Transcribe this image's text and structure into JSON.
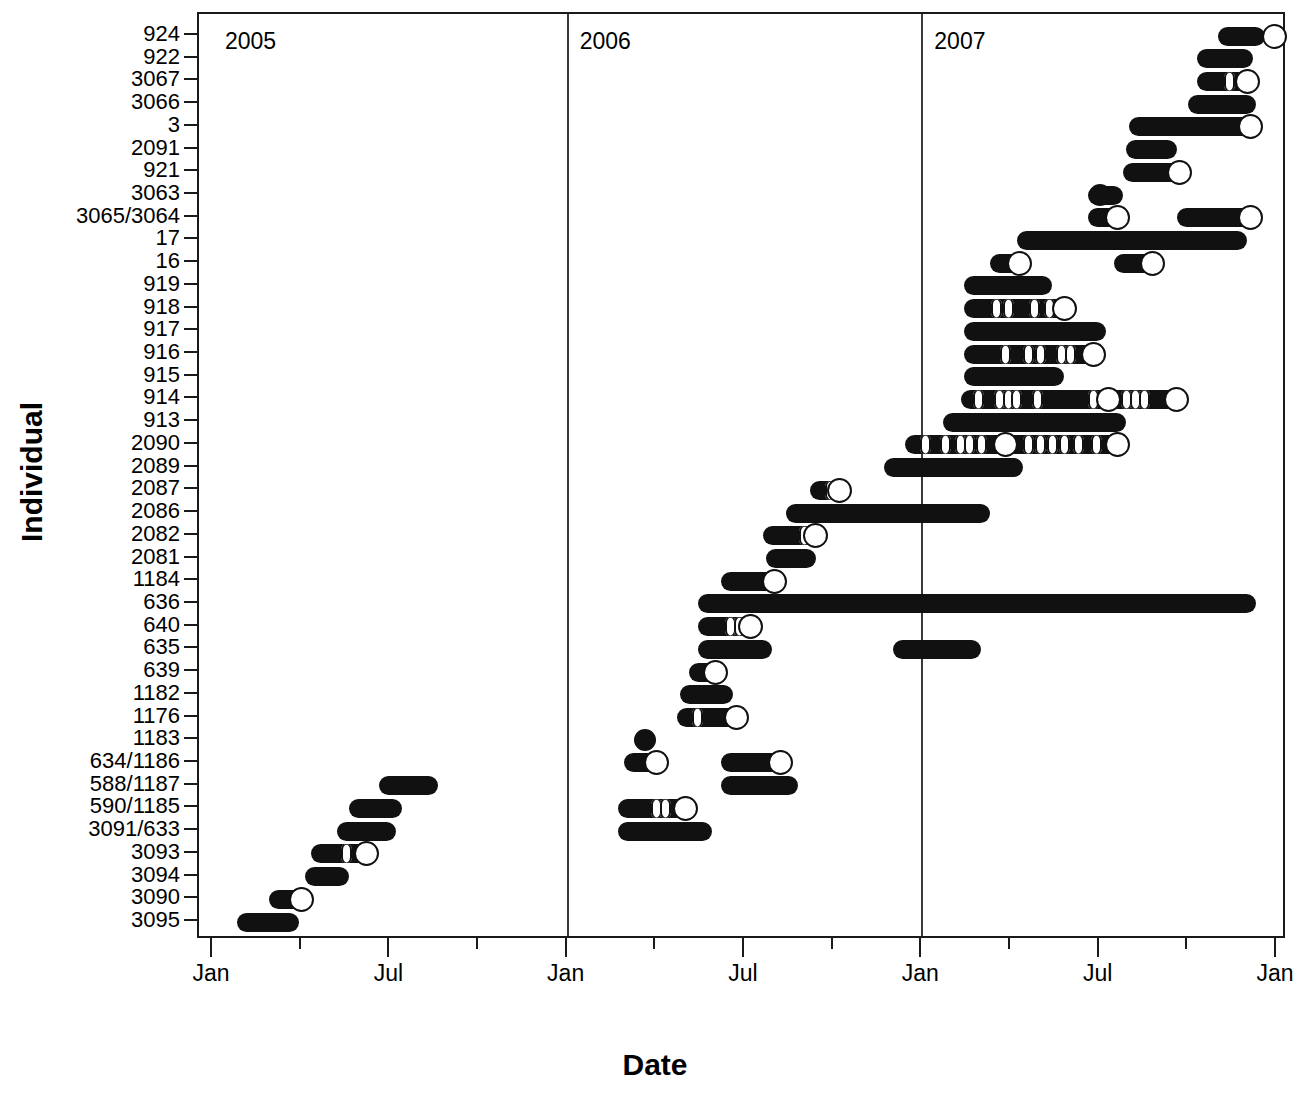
{
  "chart_data": {
    "type": "bar",
    "chart_subtype": "horizontal-gantt-timeline",
    "title": "",
    "xlabel": "Date",
    "ylabel": "Individual",
    "xlim": [
      "2005-01-01",
      "2008-01-01"
    ],
    "x_tick_labels": [
      "Jan",
      "Jul",
      "Jan",
      "Jul",
      "Jan",
      "Jul",
      "Jan"
    ],
    "x_tick_major_months": [
      0,
      6,
      12,
      18,
      24,
      30,
      36
    ],
    "x_minor_tick_interval_months": 3,
    "grid": false,
    "legend": null,
    "year_separators": [
      {
        "label": "2005",
        "at_month": 0
      },
      {
        "label": "2006",
        "at_month": 12
      },
      {
        "label": "2007",
        "at_month": 24
      }
    ],
    "categories": [
      "924",
      "922",
      "3067",
      "3066",
      "3",
      "2091",
      "921",
      "3063",
      "3065/3064",
      "17",
      "16",
      "919",
      "918",
      "917",
      "916",
      "915",
      "914",
      "913",
      "2090",
      "2089",
      "2087",
      "2086",
      "2082",
      "2081",
      "1184",
      "636",
      "640",
      "635",
      "639",
      "1182",
      "1176",
      "1183",
      "634/1186",
      "588/1187",
      "590/1185",
      "3091/633",
      "3093",
      "3094",
      "3090",
      "3095"
    ],
    "series": [
      {
        "individual": "924",
        "segments": [
          {
            "start_month": 34.0,
            "end_month": 35.6
          }
        ],
        "open_circles": [
          35.9
        ],
        "filled_dots": []
      },
      {
        "individual": "922",
        "segments": [
          {
            "start_month": 33.3,
            "end_month": 35.2
          }
        ],
        "open_circles": [],
        "filled_dots": []
      },
      {
        "individual": "3067",
        "segments": [
          {
            "start_month": 33.3,
            "end_month": 35.2
          }
        ],
        "open_circles": [
          35.0
        ],
        "filled_dots": [],
        "notches": [
          34.4
        ]
      },
      {
        "individual": "3066",
        "segments": [
          {
            "start_month": 33.4,
            "end_month": 35.3
          }
        ],
        "open_circles": [],
        "filled_dots": []
      },
      {
        "individual": "3",
        "segments": [
          {
            "start_month": 31.0,
            "end_month": 35.2
          }
        ],
        "open_circles": [
          35.1
        ],
        "filled_dots": []
      },
      {
        "individual": "2091",
        "segments": [
          {
            "start_month": 30.9,
            "end_month": 32.6
          }
        ],
        "open_circles": [],
        "filled_dots": []
      },
      {
        "individual": "921",
        "segments": [
          {
            "start_month": 30.8,
            "end_month": 32.8
          }
        ],
        "open_circles": [
          32.7
        ],
        "filled_dots": []
      },
      {
        "individual": "3063",
        "segments": [
          {
            "start_month": 29.6,
            "end_month": 30.8
          }
        ],
        "open_circles": [],
        "filled_dots": [
          30.0
        ]
      },
      {
        "individual": "3065/3064",
        "segments": [
          {
            "start_month": 29.6,
            "end_month": 30.9
          },
          {
            "start_month": 32.6,
            "end_month": 35.3
          }
        ],
        "open_circles": [
          30.6,
          35.1
        ],
        "filled_dots": []
      },
      {
        "individual": "17",
        "segments": [
          {
            "start_month": 27.2,
            "end_month": 35.0
          }
        ],
        "open_circles": [],
        "filled_dots": []
      },
      {
        "individual": "16",
        "segments": [
          {
            "start_month": 26.3,
            "end_month": 27.5
          },
          {
            "start_month": 30.5,
            "end_month": 32.0
          }
        ],
        "open_circles": [
          27.3,
          31.8
        ],
        "filled_dots": []
      },
      {
        "individual": "919",
        "segments": [
          {
            "start_month": 25.4,
            "end_month": 28.4
          }
        ],
        "open_circles": [],
        "filled_dots": []
      },
      {
        "individual": "918",
        "segments": [
          {
            "start_month": 25.4,
            "end_month": 29.0
          }
        ],
        "open_circles": [
          28.8
        ],
        "filled_dots": [],
        "notches": [
          26.5,
          26.9,
          27.8,
          28.3
        ]
      },
      {
        "individual": "917",
        "segments": [
          {
            "start_month": 25.4,
            "end_month": 30.2
          }
        ],
        "open_circles": [],
        "filled_dots": []
      },
      {
        "individual": "916",
        "segments": [
          {
            "start_month": 25.4,
            "end_month": 30.0
          }
        ],
        "open_circles": [
          29.8
        ],
        "filled_dots": [],
        "notches": [
          26.8,
          27.6,
          28.0,
          28.7,
          29.0
        ]
      },
      {
        "individual": "915",
        "segments": [
          {
            "start_month": 25.4,
            "end_month": 28.8
          }
        ],
        "open_circles": [],
        "filled_dots": []
      },
      {
        "individual": "914",
        "segments": [
          {
            "start_month": 25.3,
            "end_month": 32.9
          }
        ],
        "open_circles": [
          30.3,
          32.6
        ],
        "filled_dots": [],
        "notches": [
          25.9,
          26.6,
          26.9,
          27.2,
          27.9,
          29.8,
          30.9,
          31.2,
          31.5
        ]
      },
      {
        "individual": "913",
        "segments": [
          {
            "start_month": 24.7,
            "end_month": 30.9
          }
        ],
        "open_circles": [],
        "filled_dots": []
      },
      {
        "individual": "2090",
        "segments": [
          {
            "start_month": 23.4,
            "end_month": 30.8
          }
        ],
        "open_circles": [
          26.8,
          30.6
        ],
        "filled_dots": [],
        "notches": [
          24.1,
          24.8,
          25.3,
          25.6,
          26.0,
          27.6,
          28.0,
          28.4,
          28.8,
          29.3,
          29.9
        ]
      },
      {
        "individual": "2089",
        "segments": [
          {
            "start_month": 22.7,
            "end_month": 27.4
          }
        ],
        "open_circles": [],
        "filled_dots": []
      },
      {
        "individual": "2087",
        "segments": [
          {
            "start_month": 20.2,
            "end_month": 21.4
          }
        ],
        "open_circles": [
          21.2
        ],
        "filled_dots": [],
        "notches": [
          20.9
        ]
      },
      {
        "individual": "2086",
        "segments": [
          {
            "start_month": 19.4,
            "end_month": 26.3
          }
        ],
        "open_circles": [],
        "filled_dots": []
      },
      {
        "individual": "2082",
        "segments": [
          {
            "start_month": 18.6,
            "end_month": 20.6
          }
        ],
        "open_circles": [
          20.4
        ],
        "filled_dots": [],
        "notches": [
          20.0
        ]
      },
      {
        "individual": "2081",
        "segments": [
          {
            "start_month": 18.7,
            "end_month": 20.4
          }
        ],
        "open_circles": [],
        "filled_dots": []
      },
      {
        "individual": "1184",
        "segments": [
          {
            "start_month": 17.2,
            "end_month": 19.2
          }
        ],
        "open_circles": [
          19.0
        ],
        "filled_dots": []
      },
      {
        "individual": "636",
        "segments": [
          {
            "start_month": 16.4,
            "end_month": 35.3
          }
        ],
        "open_circles": [],
        "filled_dots": []
      },
      {
        "individual": "640",
        "segments": [
          {
            "start_month": 16.4,
            "end_month": 18.4
          }
        ],
        "open_circles": [
          18.2
        ],
        "filled_dots": [],
        "notches": [
          17.5,
          17.8
        ]
      },
      {
        "individual": "635",
        "segments": [
          {
            "start_month": 16.4,
            "end_month": 18.9
          },
          {
            "start_month": 23.0,
            "end_month": 26.0
          }
        ],
        "open_circles": [],
        "filled_dots": []
      },
      {
        "individual": "639",
        "segments": [
          {
            "start_month": 16.1,
            "end_month": 17.1
          }
        ],
        "open_circles": [
          17.0
        ],
        "filled_dots": []
      },
      {
        "individual": "1182",
        "segments": [
          {
            "start_month": 15.8,
            "end_month": 17.6
          }
        ],
        "open_circles": [],
        "filled_dots": []
      },
      {
        "individual": "1176",
        "segments": [
          {
            "start_month": 15.7,
            "end_month": 17.9
          }
        ],
        "open_circles": [
          17.7
        ],
        "filled_dots": [],
        "notches": [
          16.4
        ]
      },
      {
        "individual": "1183",
        "segments": [],
        "open_circles": [],
        "filled_dots": [
          14.6
        ]
      },
      {
        "individual": "634/1186",
        "segments": [
          {
            "start_month": 13.9,
            "end_month": 15.2
          },
          {
            "start_month": 17.2,
            "end_month": 19.5
          }
        ],
        "open_circles": [
          15.0,
          19.2
        ],
        "filled_dots": []
      },
      {
        "individual": "588/1187",
        "segments": [
          {
            "start_month": 17.2,
            "end_month": 19.8
          }
        ],
        "open_circles": [],
        "filled_dots": []
      },
      {
        "individual": "590/1185",
        "segments": [
          {
            "start_month": 13.7,
            "end_month": 16.2
          }
        ],
        "open_circles": [
          16.0
        ],
        "filled_dots": [],
        "notches": [
          15.0,
          15.3
        ]
      },
      {
        "individual": "3091/633",
        "segments": [
          {
            "start_month": 13.7,
            "end_month": 16.9
          }
        ],
        "open_circles": [],
        "filled_dots": []
      },
      {
        "individual": "3093",
        "segments": [
          {
            "start_month": 3.3,
            "end_month": 5.4
          }
        ],
        "open_circles": [
          5.2
        ],
        "filled_dots": [],
        "notches": [
          4.5
        ]
      },
      {
        "individual": "3094",
        "segments": [
          {
            "start_month": 3.1,
            "end_month": 4.6
          }
        ],
        "open_circles": [],
        "filled_dots": []
      },
      {
        "individual": "3090",
        "segments": [
          {
            "start_month": 1.9,
            "end_month": 3.2
          }
        ],
        "open_circles": [
          3.0
        ],
        "filled_dots": []
      },
      {
        "individual": "3095",
        "segments": [
          {
            "start_month": 0.8,
            "end_month": 2.9
          }
        ],
        "open_circles": [],
        "filled_dots": []
      }
    ],
    "extra_top_rows": [
      {
        "individual": "3066_b",
        "segments": [
          {
            "start_month": 33.0,
            "end_month": 34.6
          }
        ]
      },
      {
        "individual": "588/1187_upper",
        "segments": [
          {
            "start_month": 5.6,
            "end_month": 7.6
          }
        ]
      },
      {
        "individual": "590/1185_upper",
        "segments": [
          {
            "start_month": 4.6,
            "end_month": 6.4
          }
        ]
      },
      {
        "individual": "3091/633_upper",
        "segments": [
          {
            "start_month": 4.2,
            "end_month": 6.2
          }
        ]
      }
    ]
  },
  "axes": {
    "y_title": "Individual",
    "x_title": "Date",
    "y_tick_labels": [
      "924",
      "922",
      "3067",
      "3066",
      "3",
      "2091",
      "921",
      "3063",
      "3065/3064",
      "17",
      "16",
      "919",
      "918",
      "917",
      "916",
      "915",
      "914",
      "913",
      "2090",
      "2089",
      "2087",
      "2086",
      "2082",
      "2081",
      "1184",
      "636",
      "640",
      "635",
      "639",
      "1182",
      "1176",
      "1183",
      "634/1186",
      "588/1187",
      "590/1185",
      "3091/633",
      "3093",
      "3094",
      "3090",
      "3095"
    ],
    "x_tick_labels": [
      "Jan",
      "Jul",
      "Jan",
      "Jul",
      "Jan",
      "Jul",
      "Jan"
    ]
  },
  "annotations": {
    "year_2005": "2005",
    "year_2006": "2006",
    "year_2007": "2007"
  },
  "colors": {
    "mark": "#111111",
    "frame": "#1a1a1a",
    "background": "#ffffff",
    "open_marker_fill": "#ffffff"
  }
}
